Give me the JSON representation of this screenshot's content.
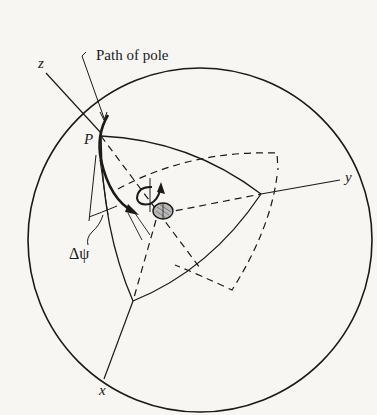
{
  "figure": {
    "labels": {
      "path_of_pole": "Path of pole",
      "z_axis": "z",
      "y_axis": "y",
      "x_axis": "x",
      "pole": "P",
      "delta_psi": "Δψ"
    },
    "colors": {
      "ink": "#1a1a1a",
      "paper": "#f7f6f3",
      "hatch": "#9a9a9a"
    }
  }
}
